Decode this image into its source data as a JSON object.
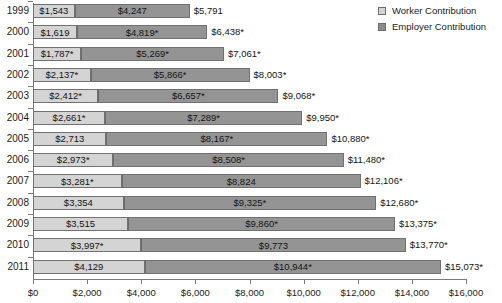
{
  "legend": {
    "items": [
      {
        "label": "Worker Contribution",
        "key": "worker",
        "color": "#d4d4d4"
      },
      {
        "label": "Employer Contribution",
        "key": "employer",
        "color": "#949494"
      }
    ]
  },
  "axis": {
    "x_min": 0,
    "x_max": 16000,
    "x_ticks": [
      0,
      2000,
      4000,
      6000,
      8000,
      10000,
      12000,
      14000,
      16000
    ],
    "x_tick_labels": [
      "$0",
      "$2,000",
      "$4,000",
      "$6,000",
      "$8,000",
      "$10,000",
      "$12,000",
      "$14,000",
      "$16,000"
    ]
  },
  "chart_data": {
    "type": "bar",
    "orientation": "horizontal",
    "stacked": true,
    "title": "",
    "subtitle": "",
    "xlabel": "",
    "ylabel": "",
    "xlim": [
      0,
      16000
    ],
    "grid": false,
    "legend_position": "top-right",
    "categories": [
      "1999",
      "2000",
      "2001",
      "2002",
      "2003",
      "2004",
      "2005",
      "2006",
      "2007",
      "2008",
      "2009",
      "2010",
      "2011"
    ],
    "series": [
      {
        "name": "Worker Contribution",
        "color": "#d4d4d4",
        "values": [
          1543,
          1619,
          1787,
          2137,
          2412,
          2661,
          2713,
          2973,
          3281,
          3354,
          3515,
          3997,
          4129
        ],
        "labels": [
          "$1,543",
          "$1,619",
          "$1,787*",
          "$2,137*",
          "$2,412*",
          "$2,661*",
          "$2,713",
          "$2,973*",
          "$3,281*",
          "$3,354",
          "$3,515",
          "$3,997*",
          "$4,129"
        ]
      },
      {
        "name": "Employer Contribution",
        "color": "#949494",
        "values": [
          4247,
          4819,
          5269,
          5866,
          6657,
          7289,
          8167,
          8508,
          8824,
          9325,
          9860,
          9773,
          10944
        ],
        "labels": [
          "$4,247",
          "$4,819*",
          "$5,269*",
          "$5,866*",
          "$6,657*",
          "$7,289*",
          "$8,167*",
          "$8,508*",
          "$8,824",
          "$9,325*",
          "$9,860*",
          "$9,773",
          "$10,944*"
        ]
      }
    ],
    "totals": [
      5791,
      6438,
      7061,
      8003,
      9068,
      9950,
      10880,
      11480,
      12106,
      12680,
      13375,
      13770,
      15073
    ],
    "total_labels": [
      "$5,791",
      "$6,438*",
      "$7,061*",
      "$8,003*",
      "$9,068*",
      "$9,950*",
      "$10,880*",
      "$11,480*",
      "$12,106*",
      "$12,680*",
      "$13,375*",
      "$13,770*",
      "$15,073*"
    ]
  }
}
